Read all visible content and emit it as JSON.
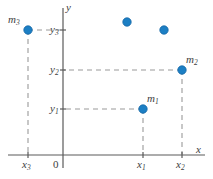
{
  "figure": {
    "colors": {
      "point": "#1c7fc4",
      "point_edge": "#1567a6",
      "axis": "#5a5a5a",
      "dashed": "#9a9a9a",
      "label": "#3d3d3d",
      "background": "#ffffff"
    },
    "axes": {
      "x_axis_label": "x",
      "y_axis_label": "y",
      "origin_label": "0",
      "x_axis_y_px": 155,
      "y_axis_x_px": 63
    },
    "x_ticks": [
      {
        "name": "x3",
        "base": "x",
        "sub": "3",
        "x_px": 28
      },
      {
        "name": "x1",
        "base": "x",
        "sub": "1",
        "x_px": 143
      },
      {
        "name": "x2",
        "base": "x",
        "sub": "2",
        "x_px": 182
      }
    ],
    "y_ticks": [
      {
        "name": "y3",
        "base": "y",
        "sub": "3",
        "y_px": 30
      },
      {
        "name": "y2",
        "base": "y",
        "sub": "2",
        "y_px": 70
      },
      {
        "name": "y1",
        "base": "y",
        "sub": "1",
        "y_px": 109
      }
    ],
    "points": [
      {
        "name": "m3",
        "base": "m",
        "sub": "3",
        "x_px": 28,
        "y_px": 30,
        "label_dx": -20,
        "label_dy": -16,
        "labeled": true
      },
      {
        "name": "m2",
        "base": "m",
        "sub": "2",
        "x_px": 182,
        "y_px": 70,
        "label_dx": 4,
        "label_dy": -16,
        "labeled": true
      },
      {
        "name": "m1",
        "base": "m",
        "sub": "1",
        "x_px": 143,
        "y_px": 109,
        "label_dx": 4,
        "label_dy": -16,
        "labeled": true
      }
    ],
    "decorative_points": [
      {
        "name": "dot-upper-left",
        "x_px": 127,
        "y_px": 22
      },
      {
        "name": "dot-upper-right",
        "x_px": 164,
        "y_px": 30
      }
    ]
  }
}
